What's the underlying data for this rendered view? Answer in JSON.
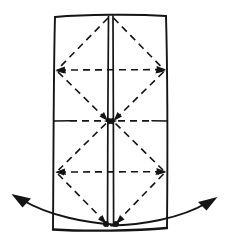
{
  "figure": {
    "background_color": "#ffffff",
    "ink_color": "#141414",
    "width": 229,
    "height": 248
  },
  "sheet": {
    "name": "folded-sheet",
    "left": 55,
    "right": 167,
    "top": 16,
    "bottom": 229,
    "corners": {
      "top_left": [
        55,
        17
      ],
      "top_right": [
        166,
        16
      ],
      "bottom_right": [
        167,
        228
      ],
      "bottom_left": [
        53,
        229
      ]
    },
    "stroke_width": 1.9
  },
  "spine": {
    "name": "center-spine-fold",
    "left_line_x": 108,
    "right_line_x": 113,
    "top": 16,
    "bottom": 229,
    "stroke_width": 1.7
  },
  "horizontal_creases": [
    {
      "name": "crease-upper",
      "y": 70,
      "style": "dashed",
      "arrow_left": true,
      "arrow_right": true
    },
    {
      "name": "crease-middle",
      "y": 121,
      "style": "dashed",
      "arrow_left": true,
      "arrow_right": true
    },
    {
      "name": "crease-lower",
      "y": 172,
      "style": "dashed",
      "arrow_left": true,
      "arrow_right": true
    }
  ],
  "diagonal_creases": [
    {
      "name": "diag-band1-left-down",
      "from": [
        110,
        18
      ],
      "to": [
        57,
        70
      ],
      "arrow_at_end": true
    },
    {
      "name": "diag-band1-right-down",
      "from": [
        111,
        18
      ],
      "to": [
        165,
        70
      ],
      "arrow_at_end": true
    },
    {
      "name": "diag-band2-left-up",
      "from": [
        57,
        70
      ],
      "to": [
        108,
        121
      ],
      "arrow_at_end": true
    },
    {
      "name": "diag-band2-right-up",
      "from": [
        165,
        70
      ],
      "to": [
        113,
        121
      ],
      "arrow_at_end": true
    },
    {
      "name": "diag-band3-left-down",
      "from": [
        108,
        121
      ],
      "to": [
        57,
        172
      ],
      "arrow_at_end": true
    },
    {
      "name": "diag-band3-right-down",
      "from": [
        113,
        121
      ],
      "to": [
        165,
        172
      ],
      "arrow_at_end": true
    },
    {
      "name": "diag-band4-left-down",
      "from": [
        57,
        172
      ],
      "to": [
        106,
        224
      ],
      "arrow_at_end": true
    },
    {
      "name": "diag-band4-right-down",
      "from": [
        165,
        172
      ],
      "to": [
        115,
        224
      ],
      "arrow_at_end": true
    }
  ],
  "pivot_dots": [
    {
      "name": "pivot-dot-left",
      "cx": 106,
      "cy": 224,
      "r": 3.0
    },
    {
      "name": "pivot-dot-right",
      "cx": 116,
      "cy": 224,
      "r": 3.0
    }
  ],
  "motion_arrows": [
    {
      "name": "swing-arrow-left",
      "direction": "outward-left",
      "path": "M 112 224 C 90 222 50 216 20 200",
      "tip": [
        13,
        196
      ],
      "head_points": "13,195 30,199 24,206"
    },
    {
      "name": "swing-arrow-right",
      "direction": "outward-right",
      "path": "M 112 225 C 140 224 180 218 209 203",
      "tip": [
        216,
        199
      ],
      "head_points": "216,198 199,203 205,210"
    }
  ],
  "labels": {
    "caption": ""
  }
}
